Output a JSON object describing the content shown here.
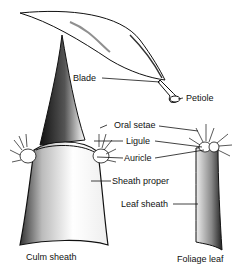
{
  "labels": {
    "blade": "Blade",
    "petiole": "Petiole",
    "oral_setae": "Oral setae",
    "ligule": "Ligule",
    "auricle": "Auricle",
    "sheath_proper": "Sheath proper",
    "leaf_sheath": "Leaf sheath",
    "culm_sheath": "Culm sheath",
    "foliage_leaf": "Foliage leaf"
  },
  "colors": {
    "ink": "#111111",
    "background": "#ffffff"
  }
}
